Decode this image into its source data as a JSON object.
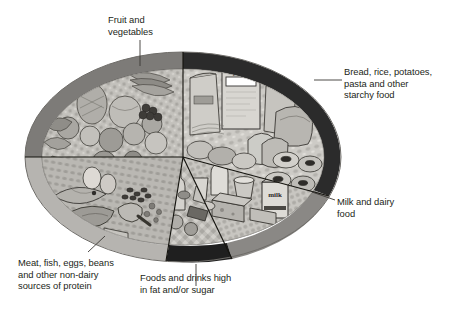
{
  "diagram": {
    "background_color": "#ffffff",
    "text_color": "#231f20"
  },
  "plate": {
    "center_x": 183,
    "center_y": 157,
    "radius_x": 158,
    "radius_y": 105,
    "rim_thickness": 17,
    "inner_fill": "#c9c7c2",
    "rim_outline": "#6f6d69",
    "divider_color": "#1a1a1a"
  },
  "segments": [
    {
      "id": "fruit-vegetables",
      "label": "Fruit and\nvegetables",
      "rim_color": "#7d7b78",
      "fill_color": "#b9b7b2",
      "start_angle": 182,
      "end_angle": 270,
      "share_percent": 33
    },
    {
      "id": "starchy-food",
      "label": "Bread, rice, potatoes,\npasta and other\nstarchy food",
      "rim_color": "#2b2b2b",
      "fill_color": "#cdcbc6",
      "start_angle": 270,
      "end_angle": 22,
      "share_percent": 33
    },
    {
      "id": "milk-dairy",
      "label": "Milk and dairy\nfood",
      "rim_color": "#8a8885",
      "fill_color": "#c4c2bd",
      "start_angle": 22,
      "end_angle": 72,
      "share_percent": 15
    },
    {
      "id": "fat-sugar",
      "label": "Foods and drinks high\nin fat and/or sugar",
      "rim_color": "#1f1f1f",
      "fill_color": "#b2b0ab",
      "start_angle": 72,
      "end_angle": 100,
      "share_percent": 8
    },
    {
      "id": "protein",
      "label": "Meat, fish, eggs, beans\nand other non-dairy\nsources of protein",
      "rim_color": "#b6b4b0",
      "fill_color": "#bdbbb6",
      "start_angle": 100,
      "end_angle": 182,
      "share_percent": 12
    }
  ],
  "labels": {
    "fruit_vegetables": "Fruit and\nvegetables",
    "starchy_food": "Bread, rice, potatoes,\npasta and other\nstarchy food",
    "milk_dairy": "Milk and dairy\nfood",
    "fat_sugar": "Foods and drinks high\nin fat and/or sugar",
    "protein": "Meat, fish, eggs, beans\nand other non-dairy\nsources of protein"
  },
  "food_text": {
    "cereal_box": "Flakes",
    "milk_carton": "milk"
  }
}
